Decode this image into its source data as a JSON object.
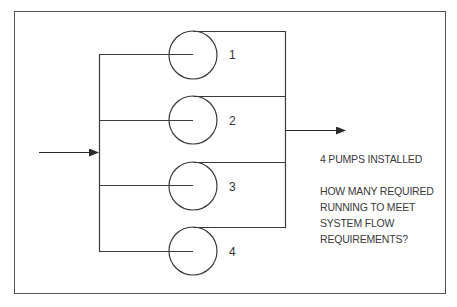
{
  "diagram": {
    "pumps": [
      {
        "label": "1"
      },
      {
        "label": "2"
      },
      {
        "label": "3"
      },
      {
        "label": "4"
      }
    ],
    "notes": {
      "installed": "4 PUMPS INSTALLED",
      "question_lines": [
        "HOW MANY REQUIRED",
        "RUNNING TO MEET",
        "SYSTEM FLOW",
        "REQUIREMENTS?"
      ]
    },
    "colors": {
      "line": "#3a3a3a",
      "frame": "#555555",
      "background": "#ffffff"
    }
  }
}
